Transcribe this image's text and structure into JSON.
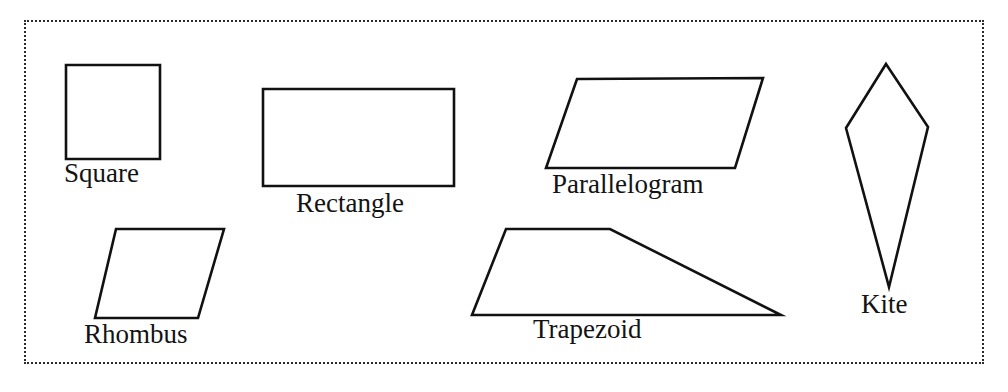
{
  "figure": {
    "background_color": "#ffffff",
    "border": {
      "style": "dotted",
      "color": "#2b2b2b",
      "width_px": 2
    },
    "stroke_color": "#111111",
    "text_color": "#131313"
  },
  "shapes": [
    {
      "id": "square",
      "label": "Square",
      "type": "polygon",
      "points": "66,65 160,65 160,159 66,159"
    },
    {
      "id": "rectangle",
      "label": "Rectangle",
      "type": "polygon",
      "points": "263,89 454,89 454,186 263,186"
    },
    {
      "id": "parallelogram",
      "label": "Parallelogram",
      "type": "polygon",
      "points": "577,79 763,78 735,168 546,168"
    },
    {
      "id": "kite",
      "label": "Kite",
      "type": "polygon",
      "points": "886,64 928,127 889,287 846,128"
    },
    {
      "id": "rhombus",
      "label": "Rhombus",
      "type": "polygon",
      "points": "116,229 224,229 198,318 95,318"
    },
    {
      "id": "trapezoid",
      "label": "Trapezoid",
      "type": "polygon",
      "points": "506,229 610,229 781,315 472,315"
    }
  ]
}
